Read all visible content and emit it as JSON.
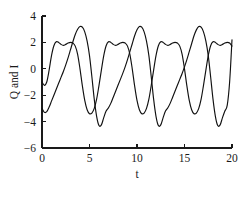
{
  "chart_data": {
    "type": "line",
    "title": "",
    "xlabel": "t",
    "ylabel": "Q and I",
    "xlim": [
      0,
      20
    ],
    "ylim": [
      -6,
      4
    ],
    "xticks": [
      0,
      5,
      10,
      15,
      20
    ],
    "xtick_labels": [
      "0",
      "5",
      "10",
      "15",
      "20"
    ],
    "yticks": [
      4,
      2,
      0,
      -2,
      -4,
      -6
    ],
    "ytick_labels": [
      "4",
      "2",
      "0",
      "−2",
      "−4",
      "−6"
    ],
    "grid": false,
    "legend": "none",
    "line_color": "#111111",
    "background_color": "#ffffff",
    "period": 6.283,
    "series": [
      {
        "name": "Q",
        "comment": "double-hump plateau near +2, trough near -3.4",
        "x": [
          0.0,
          0.25,
          0.5,
          0.75,
          1.0,
          1.25,
          1.5,
          1.75,
          2.0,
          2.25,
          2.5,
          2.75,
          3.0,
          3.25,
          3.5,
          3.75,
          4.0,
          4.25,
          4.5,
          4.75,
          5.0,
          5.25,
          5.5,
          5.75,
          6.0,
          6.25,
          6.5,
          6.75,
          7.0,
          7.25,
          7.5,
          7.75,
          8.0,
          8.25,
          8.5,
          8.75,
          9.0,
          9.25,
          9.5,
          9.75,
          10.0,
          10.25,
          10.5,
          10.75,
          11.0,
          11.25,
          11.5,
          11.75,
          12.0,
          12.25,
          12.5,
          12.75,
          13.0,
          13.25,
          13.5,
          13.75,
          14.0,
          14.25,
          14.5,
          14.75,
          15.0,
          15.25,
          15.5,
          15.75,
          16.0,
          16.25,
          16.5,
          16.75,
          17.0,
          17.25,
          17.5,
          17.75,
          18.0,
          18.25,
          18.5,
          18.75,
          19.0,
          19.25,
          19.5,
          19.75,
          20.0
        ],
        "y": [
          -1.0,
          -1.25,
          -1.0,
          -0.1,
          1.0,
          1.75,
          2.05,
          2.0,
          1.85,
          1.78,
          1.85,
          1.95,
          2.0,
          1.95,
          1.72,
          1.1,
          0.0,
          -1.3,
          -2.4,
          -3.1,
          -3.4,
          -3.35,
          -3.0,
          -2.3,
          -1.25,
          -0.1,
          1.0,
          1.75,
          2.05,
          2.0,
          1.85,
          1.78,
          1.85,
          1.95,
          2.0,
          1.95,
          1.72,
          1.1,
          0.0,
          -1.3,
          -2.4,
          -3.1,
          -3.4,
          -3.35,
          -3.0,
          -2.3,
          -1.25,
          -0.1,
          1.0,
          1.75,
          2.05,
          2.0,
          1.85,
          1.78,
          1.85,
          1.95,
          2.0,
          1.95,
          1.72,
          1.1,
          0.0,
          -1.3,
          -2.4,
          -3.1,
          -3.4,
          -3.35,
          -3.0,
          -2.3,
          -1.25,
          -0.1,
          1.0,
          1.75,
          2.05,
          2.0,
          1.85,
          1.78,
          1.85,
          1.95,
          2.0,
          1.95,
          1.72
        ]
      },
      {
        "name": "I",
        "comment": "sharp peak near +3.2, deep trough near -4.3",
        "x": [
          0.0,
          0.25,
          0.5,
          0.75,
          1.0,
          1.25,
          1.5,
          1.75,
          2.0,
          2.25,
          2.5,
          2.75,
          3.0,
          3.25,
          3.5,
          3.75,
          4.0,
          4.25,
          4.5,
          4.75,
          5.0,
          5.25,
          5.5,
          5.75,
          6.0,
          6.25,
          6.5,
          6.75,
          7.0,
          7.25,
          7.5,
          7.75,
          8.0,
          8.25,
          8.5,
          8.75,
          9.0,
          9.25,
          9.5,
          9.75,
          10.0,
          10.25,
          10.5,
          10.75,
          11.0,
          11.25,
          11.5,
          11.75,
          12.0,
          12.25,
          12.5,
          12.75,
          13.0,
          13.25,
          13.5,
          13.75,
          14.0,
          14.25,
          14.5,
          14.75,
          15.0,
          15.25,
          15.5,
          15.75,
          16.0,
          16.25,
          16.5,
          16.75,
          17.0,
          17.25,
          17.5,
          17.75,
          18.0,
          18.25,
          18.5,
          18.75,
          19.0,
          19.25,
          19.5,
          19.75,
          20.0
        ],
        "y": [
          -3.0,
          -3.3,
          -3.25,
          -2.9,
          -2.45,
          -2.0,
          -1.55,
          -1.1,
          -0.65,
          -0.2,
          0.3,
          0.85,
          1.45,
          2.05,
          2.6,
          3.0,
          3.2,
          3.15,
          2.8,
          2.1,
          1.0,
          -0.6,
          -2.3,
          -3.6,
          -4.3,
          -4.25,
          -3.7,
          -3.2,
          -2.95,
          -2.6,
          -2.15,
          -1.7,
          -1.25,
          -0.8,
          -0.35,
          0.15,
          0.7,
          1.3,
          1.9,
          2.5,
          2.95,
          3.2,
          3.15,
          2.8,
          2.1,
          1.0,
          -0.6,
          -2.3,
          -3.6,
          -4.3,
          -4.25,
          -3.7,
          -3.2,
          -2.95,
          -2.6,
          -2.15,
          -1.7,
          -1.25,
          -0.8,
          -0.35,
          0.15,
          0.7,
          1.3,
          1.9,
          2.5,
          2.95,
          3.2,
          3.15,
          2.8,
          2.1,
          1.0,
          -0.6,
          -2.3,
          -3.6,
          -4.3,
          -4.25,
          -3.7,
          -3.2,
          -2.75,
          -1.0,
          2.2
        ]
      }
    ]
  }
}
